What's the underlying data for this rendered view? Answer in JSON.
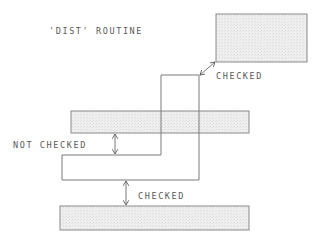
{
  "title": "'DIST' ROUTINE",
  "labels": {
    "top_checked": "CHECKED",
    "not_checked": "NOT CHECKED",
    "bottom_checked": "CHECKED"
  },
  "shapes": {
    "top_box": {
      "x": 216,
      "y": 14,
      "w": 91,
      "h": 48
    },
    "bar_upper": {
      "x": 71,
      "y": 111,
      "w": 178,
      "h": 22
    },
    "bar_lower": {
      "x": 60,
      "y": 206,
      "w": 189,
      "h": 24
    },
    "step_path": "161,180 L161,75 L199,75 L199,180 L62,180 L62,155 L161,155"
  },
  "colors": {
    "fill": "#ececec",
    "stroke": "#8a8a8a",
    "line": "#7a7a7a",
    "text": "#5a5a5a"
  }
}
